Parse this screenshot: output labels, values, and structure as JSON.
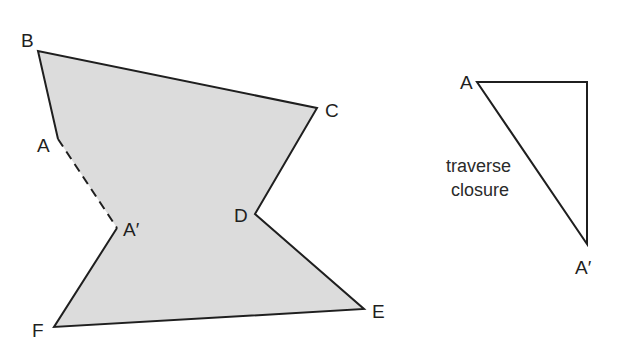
{
  "traverse": {
    "fill_color": "#dcdcdc",
    "line_color": "#1f1f1f",
    "vertices": [
      {
        "id": "B",
        "label": "B"
      },
      {
        "id": "C",
        "label": "C"
      },
      {
        "id": "D",
        "label": "D"
      },
      {
        "id": "E",
        "label": "E"
      },
      {
        "id": "F",
        "label": "F"
      },
      {
        "id": "A_prime",
        "label": "A′"
      },
      {
        "id": "A",
        "label": "A"
      }
    ],
    "closure_gap": {
      "from": "A",
      "to": "A′",
      "style": "dashed"
    }
  },
  "closure_triangle": {
    "vertices": [
      {
        "id": "A",
        "label": "A"
      },
      {
        "id": "A_prime",
        "label": "A′"
      }
    ],
    "annotation_lines": [
      "traverse",
      "closure"
    ]
  }
}
